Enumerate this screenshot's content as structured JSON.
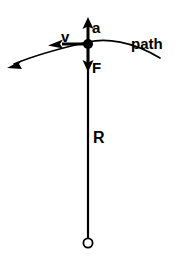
{
  "figure": {
    "type": "physics-vector-diagram",
    "background_color": "#ffffff",
    "ink_color": "#000000"
  },
  "labels": {
    "acceleration": "a",
    "velocity": "v",
    "force": "F",
    "radius": "R",
    "path": "path"
  },
  "elements": {
    "bob": {
      "name": "bob-node",
      "shape": "filled-circle",
      "center_x": 88,
      "center_y": 44,
      "radius": 5
    },
    "pivot": {
      "name": "pivot-circle",
      "shape": "hollow-circle",
      "center_x": 88,
      "center_y": 243,
      "radius": 5
    },
    "rod": {
      "name": "radius-line",
      "x": 88,
      "y_top": 44,
      "y_bottom": 238
    },
    "acceleration_vector": {
      "direction": "up",
      "from_x": 88,
      "from_y": 44,
      "to_x": 88,
      "to_y": 19
    },
    "velocity_vector": {
      "direction": "left",
      "from_x": 88,
      "from_y": 44,
      "to_x": 50,
      "to_y": 44
    },
    "force_vector": {
      "direction": "down",
      "from_x": 88,
      "from_y": 44,
      "to_x": 88,
      "to_y": 72
    },
    "path_curve": {
      "direction": "arc-from-right-to-lower-left",
      "arrow_end": "left",
      "start_x": 160,
      "start_y": 58,
      "apex_x": 88,
      "apex_y": 42,
      "end_x": 8,
      "end_y": 66
    }
  },
  "label_positions": {
    "acceleration": {
      "x": 92,
      "y": 33
    },
    "velocity": {
      "x": 61,
      "y": 42
    },
    "force": {
      "x": 92,
      "y": 72
    },
    "radius": {
      "x": 93,
      "y": 143
    },
    "path": {
      "x": 131,
      "y": 49
    }
  }
}
